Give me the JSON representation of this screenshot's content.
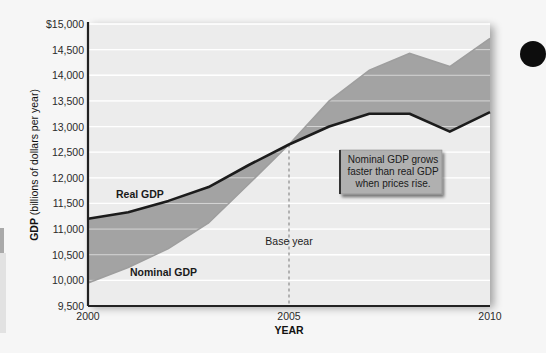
{
  "chart_data": {
    "type": "area",
    "title": "",
    "xlabel": "YEAR",
    "ylabel_bold": "GDP",
    "ylabel_rest": " (billions of dollars per year)",
    "xlim": [
      2000,
      2010
    ],
    "ylim": [
      9500,
      15000
    ],
    "x_ticks": [
      {
        "value": 2000,
        "label": "2000"
      },
      {
        "value": 2005,
        "label": "2005"
      },
      {
        "value": 2010,
        "label": "2010"
      }
    ],
    "y_ticks": [
      {
        "value": 9500,
        "label": "9,500"
      },
      {
        "value": 10000,
        "label": "10,000"
      },
      {
        "value": 10500,
        "label": "10,500"
      },
      {
        "value": 11000,
        "label": "11,000"
      },
      {
        "value": 11500,
        "label": "11,500"
      },
      {
        "value": 12000,
        "label": "12,000"
      },
      {
        "value": 12500,
        "label": "12,500"
      },
      {
        "value": 13000,
        "label": "13,000"
      },
      {
        "value": 13500,
        "label": "13,500"
      },
      {
        "value": 14000,
        "label": "14,000"
      },
      {
        "value": 14500,
        "label": "14,500"
      },
      {
        "value": 15000,
        "label": "$15,000"
      }
    ],
    "grid": true,
    "x": [
      2000,
      2001,
      2002,
      2003,
      2004,
      2005,
      2006,
      2007,
      2008,
      2009,
      2010
    ],
    "series": [
      {
        "name": "Real GDP",
        "label": "Real GDP",
        "color": "#1c1c1c",
        "values": [
          11200,
          11330,
          11550,
          11820,
          12250,
          12650,
          13000,
          13250,
          13250,
          12900,
          13280
        ]
      },
      {
        "name": "Nominal GDP",
        "label": "Nominal GDP",
        "color": "#9e9e9e",
        "values": [
          9950,
          10250,
          10620,
          11120,
          11880,
          12650,
          13500,
          14100,
          14430,
          14170,
          14720
        ]
      }
    ],
    "fill_between_color": "#a3a3a3",
    "plot_bg": "#ececec",
    "base_year": {
      "value": 2005,
      "label": "Base year"
    },
    "annotation": {
      "lines": [
        "Nominal GDP grows",
        "faster than real GDP",
        "when prices rise."
      ],
      "bg": "#b0b0b0"
    }
  }
}
